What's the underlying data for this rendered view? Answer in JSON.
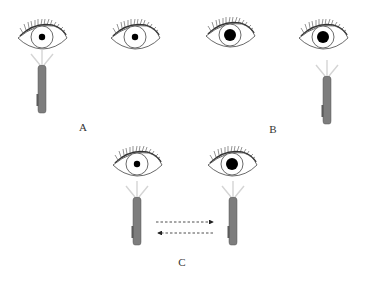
{
  "figure": {
    "panels": [
      {
        "id": "A",
        "label": "A",
        "label_pos": [
          83,
          127
        ],
        "eyes": [
          {
            "side": "left",
            "cx": 42,
            "cy": 37,
            "pupil": "constricted",
            "pupil_r": 3.2
          },
          {
            "side": "right",
            "cx": 135,
            "cy": 37,
            "pupil": "constricted",
            "pupil_r": 3.2
          }
        ],
        "penlights": [
          {
            "cx": 42,
            "top": 64,
            "shining": true
          }
        ]
      },
      {
        "id": "B",
        "label": "B",
        "label_pos": [
          273,
          129
        ],
        "eyes": [
          {
            "side": "left",
            "cx": 230,
            "cy": 35,
            "pupil": "dilated",
            "pupil_r": 6
          },
          {
            "side": "right",
            "cx": 323,
            "cy": 37,
            "pupil": "dilated",
            "pupil_r": 6
          }
        ],
        "penlights": [
          {
            "cx": 327,
            "top": 76,
            "shining": true
          }
        ]
      },
      {
        "id": "C",
        "label": "C",
        "label_pos": [
          182,
          262
        ],
        "eyes": [
          {
            "side": "left",
            "cx": 137,
            "cy": 164,
            "pupil": "constricted",
            "pupil_r": 3.2
          },
          {
            "side": "right",
            "cx": 232,
            "cy": 164,
            "pupil": "dilated",
            "pupil_r": 6
          }
        ],
        "penlights": [
          {
            "cx": 137,
            "top": 196,
            "shining": true
          },
          {
            "cx": 233,
            "top": 196,
            "shining": true
          }
        ],
        "arrows": [
          {
            "direction": "right",
            "x1": 156,
            "x2": 213,
            "y": 222,
            "style": "dashed"
          },
          {
            "direction": "left",
            "x1": 213,
            "x2": 157,
            "y": 233,
            "style": "dashed"
          }
        ]
      }
    ],
    "colors": {
      "line": "#333333",
      "pupil": "#000000",
      "penlight_body": "#7a7a7a",
      "light_rays": "#d4d4d4",
      "arrow": "#222222"
    }
  },
  "labels": {
    "a": "A",
    "b": "B",
    "c": "C"
  }
}
